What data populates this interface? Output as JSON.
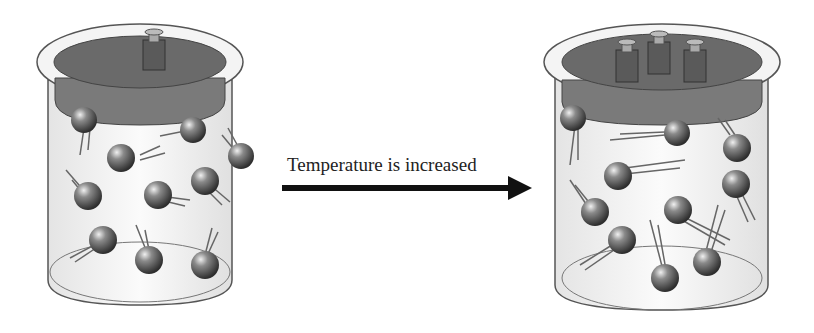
{
  "diagram": {
    "caption": "Temperature is increased",
    "left_container": {
      "weights_count": 1,
      "molecule_count": 11,
      "state": "lower temperature, single weight on piston"
    },
    "right_container": {
      "weights_count": 3,
      "molecule_count": 11,
      "state": "higher temperature, three weights on piston, longer motion trails"
    },
    "colors": {
      "lid": "#6f6f6f",
      "lid_rim": "#8a8a8a",
      "weight": "#5e5e5e",
      "glass": "#f2f2f2",
      "molecule": "#4a4a4a",
      "arrow": "#111111"
    }
  }
}
